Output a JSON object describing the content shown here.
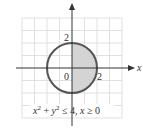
{
  "diagram": {
    "type": "region-plot",
    "axes": {
      "x_label": "x",
      "y_label": "",
      "origin_label": "0",
      "x_tick_label": "2",
      "y_tick_label": "2"
    },
    "grid": {
      "x_range": [
        -4,
        4
      ],
      "y_range": [
        -4,
        4
      ],
      "step": 1
    },
    "circle": {
      "center": [
        0,
        0
      ],
      "radius": 2
    },
    "shaded_region": "right half-disk (x ≥ 0)",
    "caption": {
      "x_var": "x",
      "plus": " + ",
      "y_var": "y",
      "exp": "2",
      "le": " ≤ 4,  ",
      "cond_var": "x",
      "cond": " ≥ 0"
    },
    "colors": {
      "shade": "#d4d4d4",
      "circle": "#555555",
      "grid": "#d9d9d9",
      "axis": "#333333"
    }
  }
}
